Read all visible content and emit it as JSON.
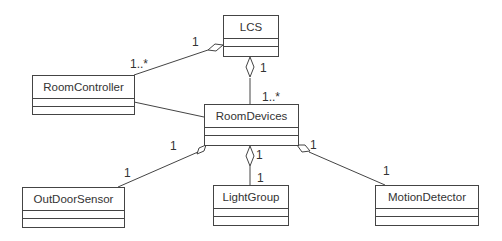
{
  "diagram": {
    "type": "UML class diagram",
    "classes": [
      {
        "id": "lcs",
        "name": "LCS"
      },
      {
        "id": "roomcontroller",
        "name": "RoomController"
      },
      {
        "id": "roomdevices",
        "name": "RoomDevices"
      },
      {
        "id": "outdoorsensor",
        "name": "OutDoorSensor"
      },
      {
        "id": "lightgroup",
        "name": "LightGroup"
      },
      {
        "id": "motiondetector",
        "name": "MotionDetector"
      }
    ],
    "relations": [
      {
        "from": "LCS",
        "to": "RoomController",
        "kind": "aggregation",
        "whole_mult": "1",
        "part_mult": "1..*"
      },
      {
        "from": "LCS",
        "to": "RoomDevices",
        "kind": "aggregation",
        "whole_mult": "1",
        "part_mult": "1..*"
      },
      {
        "from": "RoomController",
        "to": "RoomDevices",
        "kind": "association"
      },
      {
        "from": "RoomDevices",
        "to": "OutDoorSensor",
        "kind": "aggregation",
        "whole_mult": "1",
        "part_mult": "1"
      },
      {
        "from": "RoomDevices",
        "to": "LightGroup",
        "kind": "aggregation",
        "whole_mult": "1",
        "part_mult": "1"
      },
      {
        "from": "RoomDevices",
        "to": "MotionDetector",
        "kind": "aggregation",
        "whole_mult": "1",
        "part_mult": "1"
      }
    ],
    "labels": {
      "lcs_rc_whole": "1",
      "lcs_rc_part": "1..*",
      "lcs_rd_whole": "1",
      "lcs_rd_part": "1..*",
      "rd_os_whole": "1",
      "rd_os_part": "1",
      "rd_lg_whole": "1",
      "rd_lg_part": "1",
      "rd_md_whole": "1",
      "rd_md_part": "1"
    }
  }
}
